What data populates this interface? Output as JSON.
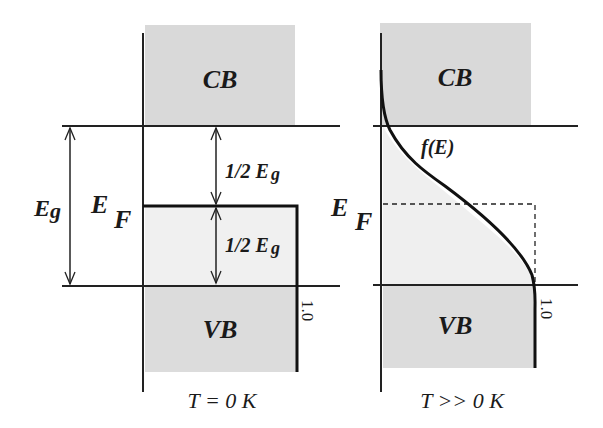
{
  "colors": {
    "band_fill": "#d9d9d9",
    "occupied_fill": "#efefef",
    "line": "#222222",
    "background": "#ffffff"
  },
  "left_panel": {
    "conduction_band_label": "CB",
    "valence_band_label": "VB",
    "band_gap_label": "E",
    "band_gap_subscript": "g",
    "fermi_label": "E",
    "fermi_subscript": "F",
    "upper_half_label": "1/2 E",
    "upper_half_subscript": "g",
    "lower_half_label": "1/2 E",
    "lower_half_subscript": "g",
    "occupancy_value": "1.0",
    "temperature_label": "T = 0 K"
  },
  "right_panel": {
    "conduction_band_label": "CB",
    "valence_band_label": "VB",
    "fermi_label": "E",
    "fermi_subscript": "F",
    "distribution_label": "f(E)",
    "occupancy_value": "1.0",
    "temperature_label": "T >> 0 K"
  }
}
